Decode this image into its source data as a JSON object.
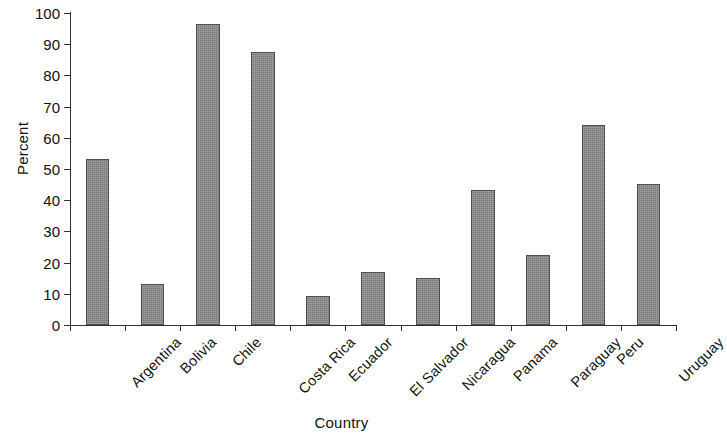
{
  "chart_data": {
    "type": "bar",
    "title": "",
    "xlabel": "Country",
    "ylabel": "Percent",
    "categories": [
      "Argentina",
      "Bolivia",
      "Chile",
      "Costa Rica",
      "Ecuador",
      "El Salvador",
      "Nicaragua",
      "Panama",
      "Paraguay",
      "Peru",
      "Uruguay"
    ],
    "values": [
      53.3,
      13.2,
      96.5,
      87.4,
      9.2,
      17.0,
      15.1,
      43.4,
      22.3,
      64.2,
      45.2
    ],
    "ylim": [
      0,
      100
    ],
    "ytick_labels": [
      "0",
      "10",
      "20",
      "30",
      "40",
      "50",
      "60",
      "70",
      "80",
      "90",
      "100"
    ],
    "ytick_values": [
      0,
      10,
      20,
      30,
      40,
      50,
      60,
      70,
      80,
      90,
      100
    ],
    "grid": false,
    "legend": null,
    "bar_color": "#8a8a8a",
    "bar_edge_color": "#4d4d4d",
    "axis_color": "#303030",
    "background_color": "#ffffff"
  }
}
